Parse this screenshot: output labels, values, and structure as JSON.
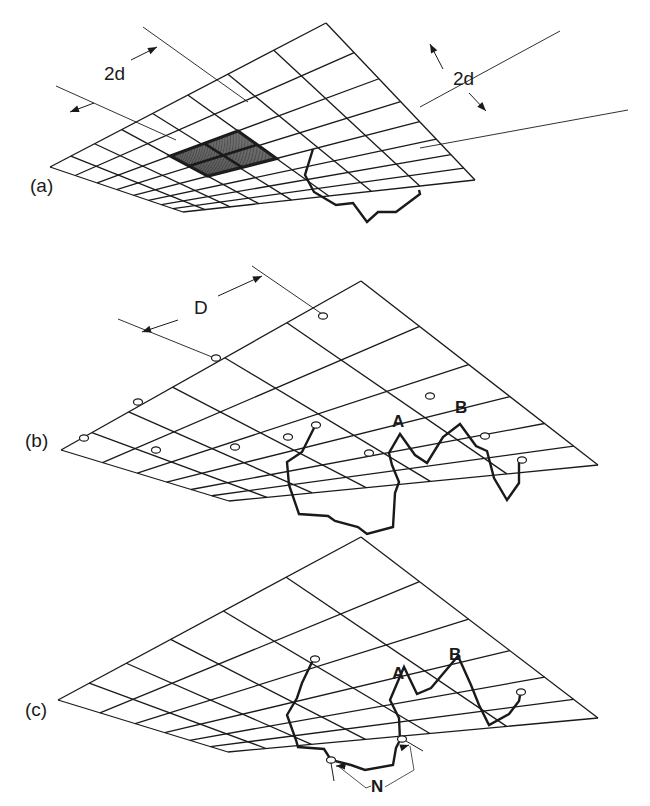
{
  "figure": {
    "colors": {
      "ink": "#1a1a1a",
      "background": "#ffffff",
      "hatch": "#222222"
    },
    "panels": [
      {
        "id": "a",
        "label": "(a)",
        "label_pos": [
          30,
          192
        ],
        "grid": {
          "apex": [
            326,
            23
          ],
          "left": [
            50,
            167
          ],
          "right": [
            475,
            180
          ],
          "near": [
            183,
            212
          ],
          "cols": 8,
          "rows": 8
        },
        "dimensions": [
          {
            "label": "2d",
            "text_pos": [
              113,
              79
            ],
            "line1": [
              [
                56,
                86
              ],
              [
                160,
                40
              ]
            ],
            "arrow_from": [
              99,
              101
            ],
            "arrow_to": [
              156,
              43
            ]
          },
          {
            "label": "2d",
            "text_pos": [
              465,
              84
            ],
            "line1": [
              [
                509,
                45
              ],
              [
                568,
                123
              ]
            ],
            "arrow_from": [
              493,
              58
            ],
            "arrow_to": [
              512,
              41
            ]
          }
        ],
        "highlight_cells": {
          "from": [
            2,
            3
          ],
          "to": [
            4,
            5
          ]
        },
        "chain": [
          [
            313,
            149
          ],
          [
            305,
            175
          ],
          [
            314,
            192
          ],
          [
            336,
            205
          ],
          [
            353,
            203
          ],
          [
            367,
            222
          ],
          [
            378,
            212
          ],
          [
            396,
            212
          ],
          [
            404,
            206
          ],
          [
            420,
            194
          ],
          [
            419,
            190
          ]
        ]
      },
      {
        "id": "b",
        "label": "(b)",
        "label_pos": [
          25,
          447
        ],
        "grid": {
          "apex": [
            361,
            281
          ],
          "left": [
            61,
            450
          ],
          "right": [
            598,
            465
          ],
          "near": [
            229,
            501
          ],
          "cols": 6,
          "rows": 6
        },
        "dimension": {
          "label": "D",
          "text_pos": [
            196,
            313
          ]
        },
        "point_labels": [
          {
            "label": "A",
            "pos": [
              397,
              426
            ]
          },
          {
            "label": "B",
            "pos": [
              462,
              412
            ]
          }
        ],
        "chain_1": [
          [
            315,
            426
          ],
          [
            302,
            452
          ],
          [
            287,
            462
          ],
          [
            289,
            485
          ],
          [
            299,
            514
          ],
          [
            328,
            516
          ],
          [
            335,
            521
          ],
          [
            358,
            527
          ],
          [
            367,
            534
          ],
          [
            393,
            527
          ],
          [
            395,
            493
          ],
          [
            399,
            482
          ],
          [
            392,
            465
          ],
          [
            389,
            453
          ],
          [
            400,
            434
          ],
          [
            415,
            455
          ],
          [
            427,
            463
          ],
          [
            443,
            437
          ],
          [
            460,
            424
          ],
          [
            476,
            446
          ],
          [
            487,
            451
          ],
          [
            494,
            478
          ],
          [
            507,
            500
          ],
          [
            519,
            483
          ],
          [
            519,
            462
          ]
        ],
        "open_nodes": [
          [
            323,
            316
          ],
          [
            216,
            358
          ],
          [
            138,
            402
          ],
          [
            84,
            438
          ],
          [
            316,
            425
          ],
          [
            430,
            396
          ],
          [
            485,
            436
          ],
          [
            522,
            460
          ],
          [
            156,
            450
          ],
          [
            235,
            447
          ],
          [
            369,
            453
          ],
          [
            288,
            437
          ]
        ]
      },
      {
        "id": "c",
        "label": "(c)",
        "label_pos": [
          25,
          716
        ],
        "grid": {
          "apex": [
            361,
            537
          ],
          "left": [
            58,
            700
          ],
          "right": [
            598,
            718
          ],
          "near": [
            228,
            752
          ],
          "cols": 6,
          "rows": 6
        },
        "point_labels": [
          {
            "label": "A",
            "pos": [
              397,
              678
            ]
          },
          {
            "label": "B",
            "pos": [
              453,
              659
            ]
          }
        ],
        "chain": [
          [
            313,
            660
          ],
          [
            302,
            683
          ],
          [
            297,
            698
          ],
          [
            287,
            715
          ],
          [
            296,
            740
          ],
          [
            298,
            747
          ],
          [
            324,
            749
          ],
          [
            331,
            760
          ],
          [
            351,
            765
          ],
          [
            365,
            770
          ],
          [
            393,
            765
          ],
          [
            396,
            748
          ],
          [
            400,
            740
          ],
          [
            399,
            718
          ],
          [
            390,
            700
          ],
          [
            404,
            667
          ],
          [
            417,
            694
          ],
          [
            431,
            688
          ],
          [
            458,
            656
          ],
          [
            471,
            685
          ],
          [
            479,
            705
          ],
          [
            489,
            725
          ],
          [
            509,
            714
          ],
          [
            519,
            701
          ],
          [
            521,
            690
          ]
        ],
        "annotation": {
          "label": "N",
          "text_pos": [
            375,
            791
          ],
          "nodes": [
            [
              331,
              760
            ],
            [
              402,
              739
            ]
          ]
        }
      }
    ]
  }
}
